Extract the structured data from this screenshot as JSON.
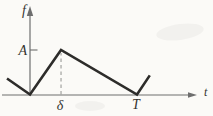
{
  "colors": {
    "ink": "#2d2c2a",
    "axis": "#6e6e6e",
    "guide": "#9b9b98",
    "text": "#35342f",
    "background": "#fbfaf7"
  },
  "chart_data": {
    "type": "line",
    "xlabel": "t",
    "ylabel": "f",
    "grid": false,
    "legend": false,
    "x_range_in_T_units": [
      -0.26,
      1.56
    ],
    "y_range_in_A_units": [
      0,
      1.9
    ],
    "y_ticks": [
      {
        "label": "A",
        "value": 1
      }
    ],
    "x_ticks": [
      {
        "label": "δ",
        "value": 0.29
      },
      {
        "label": "T",
        "value": 1.0
      }
    ],
    "series": [
      {
        "name": "f(t)",
        "points": [
          [
            -0.215,
            0.36
          ],
          [
            0,
            0
          ],
          [
            0.29,
            1
          ],
          [
            1,
            0
          ],
          [
            1.12,
            0.43
          ]
        ]
      }
    ],
    "guides": [
      {
        "style": "dashed",
        "from": [
          0.29,
          0
        ],
        "to": [
          0.29,
          0.93
        ]
      }
    ]
  }
}
